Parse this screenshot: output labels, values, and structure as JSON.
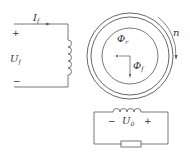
{
  "field_circuit": {
    "current_label": "I",
    "current_sub": "f",
    "voltage_label": "U",
    "voltage_sub": "f",
    "plus": "+",
    "minus": "−"
  },
  "machine": {
    "rotor_flux_label": "Φ",
    "rotor_flux_sub": "r",
    "field_flux_label": "Φ",
    "field_flux_sub": "f",
    "speed_label": "n"
  },
  "armature_circuit": {
    "voltage_label": "U",
    "voltage_sub": "0",
    "minus": "−",
    "plus": "+"
  },
  "colors": {
    "line": "#555555",
    "text": "#333333"
  }
}
